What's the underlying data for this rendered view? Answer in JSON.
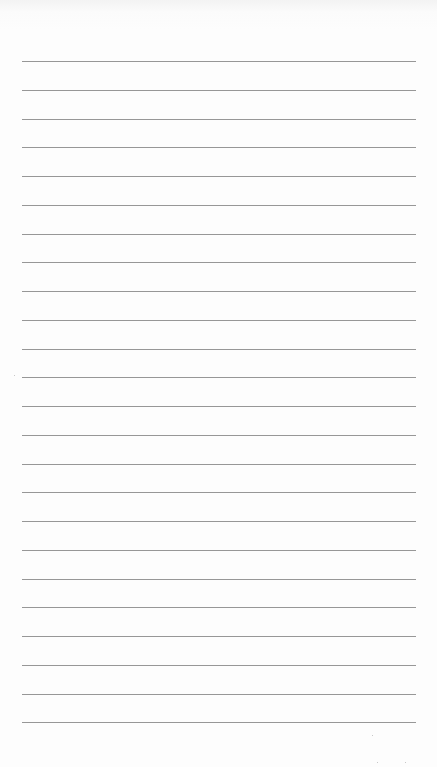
{
  "document": {
    "type": "lined-paper",
    "background_color": "#fdfdfd",
    "rule_color": "#8c8c8c",
    "rules": {
      "count": 24,
      "first_y": 61,
      "spacing": 28.75,
      "left": 22,
      "right": 416,
      "thickness": 1
    },
    "text_lines": []
  }
}
